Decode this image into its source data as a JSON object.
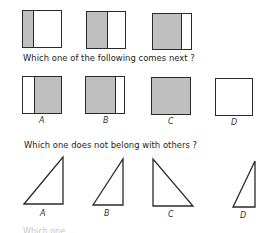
{
  "sequence": {
    "items": [
      {
        "id": 1,
        "shaded_fraction": 0.25,
        "shaded_side": "left"
      },
      {
        "id": 2,
        "shaded_fraction": 0.5,
        "shaded_side": "left"
      },
      {
        "id": 3,
        "shaded_fraction": 0.75,
        "shaded_side": "left"
      }
    ]
  },
  "question1": {
    "text": "Which one of the following comes next ?",
    "options": [
      {
        "label": "A",
        "description": "square with white left strip, rest shaded"
      },
      {
        "label": "B",
        "description": "square shaded with white right strip"
      },
      {
        "label": "C",
        "description": "fully shaded square"
      },
      {
        "label": "D",
        "description": "empty white square"
      }
    ]
  },
  "question2": {
    "text": "Which one does not belong with others ?",
    "options": [
      {
        "label": "A",
        "description": "right triangle, right angle bottom-right"
      },
      {
        "label": "B",
        "description": "right triangle, right angle bottom-right"
      },
      {
        "label": "C",
        "description": "right triangle, right angle bottom-left"
      },
      {
        "label": "D",
        "description": "narrow right triangle, right angle bottom-right"
      }
    ]
  },
  "clipped_next_question": "Which one ...",
  "colors": {
    "shade": "#bfbfbf",
    "line": "#2a2a2a",
    "background": "#ffffff"
  }
}
